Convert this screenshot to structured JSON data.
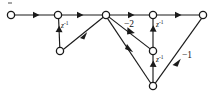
{
  "figure": {
    "type": "signal flow graph / filter structure",
    "background_color": "#ffffff",
    "stroke_color": "#1a1a1a",
    "node_fill": "#ffffff"
  },
  "nodes": [
    {
      "id": "n0",
      "name": "input-node",
      "x": 11,
      "y": 15,
      "r": 3.6
    },
    {
      "id": "n1",
      "name": "node-top-2",
      "x": 58,
      "y": 15,
      "r": 3.6
    },
    {
      "id": "n2",
      "name": "node-top-3",
      "x": 106,
      "y": 15,
      "r": 3.6
    },
    {
      "id": "n3",
      "name": "node-top-4",
      "x": 153,
      "y": 15,
      "r": 3.6
    },
    {
      "id": "n4",
      "name": "output-node",
      "x": 203,
      "y": 15,
      "r": 3.6
    },
    {
      "id": "n5",
      "name": "node-lower-left",
      "x": 60,
      "y": 51,
      "r": 3.6
    },
    {
      "id": "n6",
      "name": "node-mid-right",
      "x": 153,
      "y": 51,
      "r": 3.6
    },
    {
      "id": "n7",
      "name": "node-bottom",
      "x": 153,
      "y": 86,
      "r": 3.6
    }
  ],
  "edges": [
    {
      "name": "edge-input-to-n1",
      "from": "n0",
      "to": "n1",
      "label": "",
      "arrow_t": 0.55
    },
    {
      "name": "edge-n1-to-n2",
      "from": "n1",
      "to": "n2",
      "label": "",
      "arrow_t": 0.5
    },
    {
      "name": "edge-n2-to-n3",
      "from": "n2",
      "to": "n3",
      "label": "",
      "arrow_t": 0.55
    },
    {
      "name": "edge-n3-to-n4",
      "from": "n3",
      "to": "n4",
      "label": "",
      "arrow_t": 0.52
    },
    {
      "name": "edge-n1-to-n5-delay",
      "from": "n1",
      "to": "n5",
      "label": "z-1",
      "arrow_t": 0.55
    },
    {
      "name": "edge-n5-to-n2",
      "from": "n5",
      "to": "n2",
      "label": "",
      "arrow_t": 0.52
    },
    {
      "name": "edge-n2-to-n6-gain",
      "from": "n2",
      "to": "n6",
      "label": "-2",
      "arrow_t": 0.56
    },
    {
      "name": "edge-n3-to-n6-delay",
      "from": "n3",
      "to": "n6",
      "label": "z-1",
      "arrow_t": 0.58
    },
    {
      "name": "edge-n6-to-n7-delay",
      "from": "n6",
      "to": "n7",
      "label": "z-1",
      "arrow_t": 0.56
    },
    {
      "name": "edge-n2-to-n7",
      "from": "n2",
      "to": "n7",
      "label": "",
      "arrow_t": 0.55
    },
    {
      "name": "edge-n7-to-n4-gain",
      "from": "n7",
      "to": "n4",
      "label": "-1",
      "arrow_t": 0.52
    }
  ],
  "labels": {
    "delay_left": {
      "base": "z",
      "exp": "-1",
      "x": 62,
      "y": 27
    },
    "gain_minus2": {
      "text": "−2",
      "x": 128,
      "y": 26
    },
    "delay_mid": {
      "base": "z",
      "exp": "-1",
      "x": 157,
      "y": 26
    },
    "delay_lower": {
      "base": "z",
      "exp": "-1",
      "x": 157,
      "y": 59
    },
    "gain_minus1": {
      "text": "−1",
      "x": 186,
      "y": 55
    }
  }
}
